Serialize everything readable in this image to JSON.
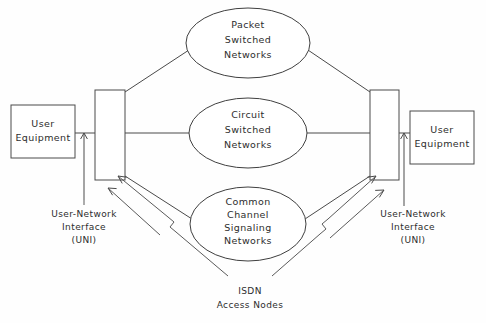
{
  "diagram": {
    "colors": {
      "background": "#fefefe",
      "stroke": "#4a4a4a",
      "text": "#2d2d2d",
      "fill": "#ffffff"
    },
    "user_equipment": {
      "left": {
        "line1": "User",
        "line2": "Equipment"
      },
      "right": {
        "line1": "User",
        "line2": "Equipment"
      }
    },
    "networks": {
      "packet": {
        "line1": "Packet",
        "line2": "Switched",
        "line3": "Networks"
      },
      "circuit": {
        "line1": "Circuit",
        "line2": "Switched",
        "line3": "Networks"
      },
      "signaling": {
        "line1": "Common",
        "line2": "Channel",
        "line3": "Signaling",
        "line4": "Networks"
      }
    },
    "annotations": {
      "uni_left": {
        "line1": "User-Network",
        "line2": "Interface",
        "line3": "(UNI)"
      },
      "uni_right": {
        "line1": "User-Network",
        "line2": "Interface",
        "line3": "(UNI)"
      },
      "isdn_nodes": {
        "line1": "ISDN",
        "line2": "Access Nodes"
      }
    }
  }
}
